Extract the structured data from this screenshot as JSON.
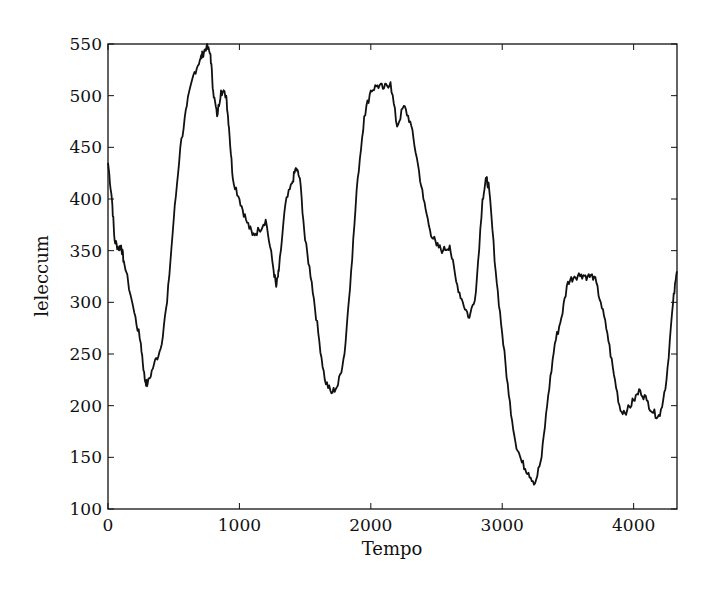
{
  "chart_data": {
    "type": "line",
    "title": "",
    "xlabel": "Tempo",
    "ylabel": "leleccum",
    "xlim": [
      0,
      4330
    ],
    "ylim": [
      100,
      550
    ],
    "xticks": [
      0,
      1000,
      2000,
      3000,
      4000
    ],
    "yticks": [
      100,
      150,
      200,
      250,
      300,
      350,
      400,
      450,
      500,
      550
    ],
    "grid": false,
    "legend": null,
    "line_color": "#111111",
    "series": [
      {
        "name": "leleccum",
        "x": [
          0,
          30,
          50,
          80,
          100,
          120,
          200,
          250,
          280,
          300,
          350,
          400,
          450,
          500,
          550,
          600,
          650,
          700,
          720,
          750,
          780,
          800,
          830,
          860,
          900,
          920,
          950,
          1000,
          1050,
          1100,
          1150,
          1200,
          1250,
          1280,
          1300,
          1350,
          1400,
          1430,
          1460,
          1500,
          1550,
          1600,
          1650,
          1700,
          1750,
          1800,
          1850,
          1900,
          1950,
          2000,
          2050,
          2100,
          2150,
          2200,
          2250,
          2300,
          2350,
          2400,
          2450,
          2500,
          2550,
          2600,
          2650,
          2700,
          2750,
          2800,
          2850,
          2880,
          2900,
          2950,
          3000,
          3050,
          3100,
          3150,
          3200,
          3250,
          3300,
          3350,
          3400,
          3450,
          3500,
          3550,
          3600,
          3650,
          3700,
          3750,
          3800,
          3850,
          3900,
          3950,
          4000,
          4050,
          4100,
          4150,
          4200,
          4250,
          4300,
          4330
        ],
        "values": [
          435,
          400,
          360,
          352,
          355,
          340,
          290,
          260,
          225,
          220,
          240,
          255,
          300,
          380,
          450,
          490,
          520,
          535,
          540,
          548,
          540,
          505,
          480,
          505,
          500,
          470,
          420,
          400,
          380,
          365,
          370,
          380,
          340,
          315,
          330,
          395,
          415,
          430,
          420,
          360,
          320,
          270,
          225,
          212,
          220,
          250,
          330,
          420,
          480,
          505,
          510,
          507,
          513,
          470,
          490,
          475,
          440,
          400,
          370,
          355,
          350,
          355,
          320,
          300,
          285,
          310,
          400,
          420,
          410,
          330,
          270,
          210,
          165,
          145,
          135,
          125,
          150,
          210,
          260,
          285,
          320,
          325,
          327,
          325,
          325,
          300,
          270,
          230,
          195,
          195,
          205,
          215,
          205,
          193,
          190,
          225,
          300,
          330
        ]
      }
    ]
  }
}
